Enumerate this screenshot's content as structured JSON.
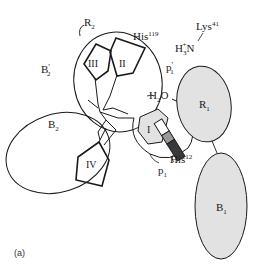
{
  "figure": {
    "panel_label": "(a)",
    "colors": {
      "stroke": "#1a1a1a",
      "subsite_fill": "#e2e2e2",
      "rod_light": "#9a9a9a",
      "rod_dark": "#3a3a3a",
      "background": "#ffffff"
    },
    "subsites": {
      "R2": {
        "base": "R",
        "sub": "2"
      },
      "B2": {
        "base": "B",
        "sub": "2"
      },
      "B2_prime": {
        "base": "B",
        "prime": "′",
        "sub": "2"
      },
      "R1": {
        "base": "R",
        "sub": "1"
      },
      "B1": {
        "base": "B",
        "sub": "1"
      },
      "p1": {
        "base": "p",
        "sub": "1"
      },
      "p1_prime": {
        "base": "p",
        "prime": "′",
        "sub": "1"
      }
    },
    "residues": {
      "his119": {
        "base": "His",
        "sup": "119"
      },
      "his12": {
        "base": "His",
        "sup": "12"
      },
      "lys41": {
        "base": "Lys",
        "sup": "41"
      },
      "amine": {
        "h": "H",
        "sub": "3",
        "sup": "+",
        "n": "N"
      },
      "water": {
        "h": "H",
        "sub": "2",
        "o": "O"
      }
    },
    "pentagons": {
      "I": "I",
      "II": "II",
      "III": "III",
      "IV": "IV"
    }
  }
}
